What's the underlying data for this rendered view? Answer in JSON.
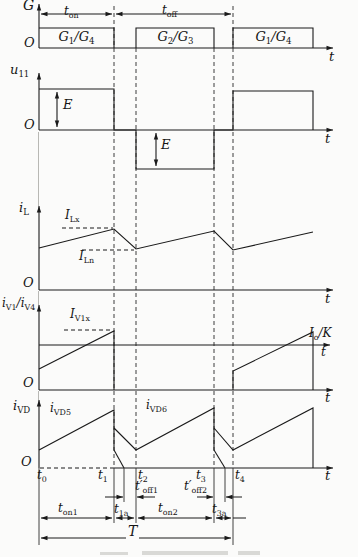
{
  "colors": {
    "ink": "#1a1a1a",
    "background": "#fbfbfa"
  },
  "panel_g": {
    "axis_label": "G",
    "origin": "O",
    "t_label": "t",
    "t_on": [
      [
        "t",
        0
      ],
      [
        "on",
        1
      ]
    ],
    "t_off": [
      [
        "t",
        0
      ],
      [
        "off",
        1
      ]
    ],
    "pulse1": [
      [
        "G",
        0
      ],
      [
        "1",
        1
      ],
      [
        "/G",
        0
      ],
      [
        "4",
        1
      ]
    ],
    "pulse2": [
      [
        "G",
        0
      ],
      [
        "2",
        1
      ],
      [
        "/G",
        0
      ],
      [
        "3",
        1
      ]
    ],
    "pulse3": [
      [
        "G",
        0
      ],
      [
        "1",
        1
      ],
      [
        "/G",
        0
      ],
      [
        "4",
        1
      ]
    ]
  },
  "panel_u": {
    "axis_label": [
      [
        "u",
        0
      ],
      [
        "11",
        1
      ]
    ],
    "origin": "O",
    "t_label": "t",
    "e_pos": "E",
    "e_neg": "E"
  },
  "panel_il": {
    "axis_label": [
      [
        "i",
        0
      ],
      [
        "L",
        1
      ]
    ],
    "origin": "O",
    "t_label": "t",
    "i_lx": [
      [
        "I",
        0
      ],
      [
        "Lx",
        1
      ]
    ],
    "i_ln": [
      [
        "I",
        0
      ],
      [
        "Ln",
        1
      ]
    ]
  },
  "panel_iv": {
    "axis_label": [
      [
        "i",
        0
      ],
      [
        "V1",
        1
      ],
      [
        "/i",
        0
      ],
      [
        "V4",
        1
      ]
    ],
    "origin": "O",
    "t_label": "t",
    "t_label_iok": "t",
    "i_v1x": [
      [
        "I",
        0
      ],
      [
        "V1x",
        1
      ]
    ],
    "io_over_k": [
      [
        "I",
        0
      ],
      [
        "o",
        1
      ],
      [
        "/K",
        0
      ]
    ]
  },
  "panel_ivd": {
    "axis_label": [
      [
        "i",
        0
      ],
      [
        "VD",
        1
      ]
    ],
    "origin": "O",
    "t_label": "t",
    "ivd5": [
      [
        "i",
        0
      ],
      [
        "VD5",
        1
      ]
    ],
    "ivd6": [
      [
        "i",
        0
      ],
      [
        "VD6",
        1
      ]
    ],
    "t0": [
      [
        "t",
        0
      ],
      [
        "0",
        1
      ]
    ],
    "t1": [
      [
        "t",
        0
      ],
      [
        "1",
        1
      ]
    ],
    "t2": [
      [
        "t",
        0
      ],
      [
        "2",
        1
      ]
    ],
    "t3": [
      [
        "t",
        0
      ],
      [
        "3",
        1
      ]
    ],
    "t4": [
      [
        "t",
        0
      ],
      [
        "4",
        1
      ]
    ],
    "t_off1": [
      [
        "t′",
        0
      ],
      [
        "off1",
        1
      ]
    ],
    "t_off2": [
      [
        "t′",
        0
      ],
      [
        "off2",
        1
      ]
    ],
    "t_on1": [
      [
        "t",
        0
      ],
      [
        "on1",
        1
      ]
    ],
    "t_1a": [
      [
        "t",
        0
      ],
      [
        "1a",
        1
      ]
    ],
    "t_on2": [
      [
        "t",
        0
      ],
      [
        "on2",
        1
      ]
    ],
    "t_3a": [
      [
        "t",
        0
      ],
      [
        "3a",
        1
      ]
    ],
    "period": "T"
  }
}
